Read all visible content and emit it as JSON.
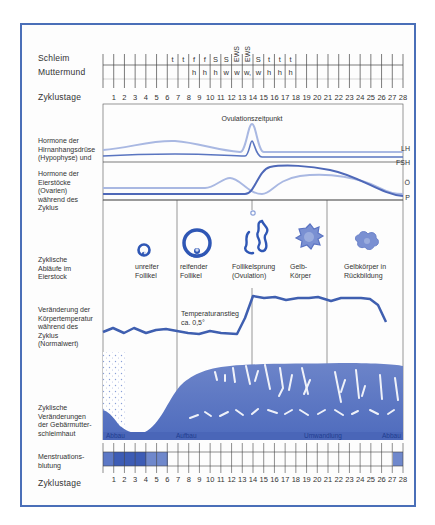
{
  "rows": {
    "schleim": {
      "label": "Schleim",
      "marks": [
        "",
        "",
        "",
        "",
        "",
        "",
        "t",
        "t",
        "f",
        "f",
        "S",
        "S",
        "EWS",
        "EWS",
        "S",
        "t",
        "t",
        "t",
        "",
        "",
        "",
        "",
        "",
        "",
        "",
        "",
        "",
        ""
      ]
    },
    "muttermund": {
      "label": "Muttermund",
      "marks": [
        "",
        "",
        "",
        "",
        "",
        "",
        "",
        "",
        "h",
        "h",
        "h",
        "w",
        "w",
        "w,",
        "w",
        "h",
        "h",
        "h",
        "",
        "",
        "",
        "",
        "",
        "",
        "",
        "",
        "",
        ""
      ]
    },
    "zyklustage_top": {
      "label": "Zyklustage"
    },
    "zyklustage_bottom": {
      "label": "Zyklustage"
    },
    "days": [
      "1",
      "2",
      "3",
      "4",
      "5",
      "6",
      "7",
      "8",
      "9",
      "10",
      "11",
      "12",
      "13",
      "14",
      "15",
      "16",
      "17",
      "18",
      "19",
      "20",
      "21",
      "22",
      "23",
      "24",
      "25",
      "26",
      "27",
      "28"
    ]
  },
  "hormones": {
    "label_pituitary": [
      "Hormone der",
      "Hirnanhangsdrüse",
      "(Hypophyse) und"
    ],
    "label_ovarian": [
      "Hormone der",
      "Eierstöcke",
      "(Ovarien)",
      "während des",
      "Zyklus"
    ],
    "ovulation_label": "Ovulationszeitpunkt",
    "curves": {
      "lh": "LH",
      "fsh": "FSH",
      "oe": "Ö",
      "p": "P"
    }
  },
  "ovary": {
    "label": [
      "Zyklische",
      "Abläufe im",
      "Eierstock"
    ],
    "stages": [
      {
        "name": [
          "unreifer",
          "Follikel"
        ]
      },
      {
        "name": [
          "reifender",
          "Follikel"
        ]
      },
      {
        "name": [
          "Follikelsprung",
          "(Ovulation)"
        ]
      },
      {
        "name": [
          "Gelb-",
          "Körper"
        ]
      },
      {
        "name": [
          "Gelbkörper in",
          "Rückbildung"
        ]
      }
    ]
  },
  "temperature": {
    "label": [
      "Veränderung der",
      "Körpertemperatur",
      "während des",
      "Zyklus",
      "(Normalwert)"
    ],
    "annotation": [
      "Temperaturanstieg",
      "ca. 0,5°"
    ]
  },
  "endometrium": {
    "label": [
      "Zyklische",
      "Veränderungen",
      "der Gebärmutter-",
      "schleimhaut"
    ],
    "phases": [
      "Abbau",
      "Aufbau",
      "Umwandlung",
      "Abbau"
    ]
  },
  "menstruation": {
    "label": [
      "Menstruations-",
      "blutung"
    ]
  },
  "colors": {
    "frame": "#4a6fb8",
    "dark_blue": "#3f5fb0",
    "light_blue": "#a9b8e2",
    "mid_blue": "#6f86c8"
  },
  "chart_data": {
    "type": "line",
    "x": [
      1,
      2,
      3,
      4,
      5,
      6,
      7,
      8,
      9,
      10,
      11,
      12,
      13,
      14,
      15,
      16,
      17,
      18,
      19,
      20,
      21,
      22,
      23,
      24,
      25,
      26,
      27,
      28
    ],
    "series": [
      {
        "name": "Körpertemperatur (relative)",
        "values": [
          0,
          0.2,
          0,
          0.2,
          0,
          0.1,
          0.1,
          0.05,
          0,
          -0.05,
          0.05,
          0.05,
          0,
          0.6,
          1.0,
          0.9,
          0.95,
          0.85,
          0.9,
          0.92,
          0.95,
          0.85,
          0.9,
          0.9,
          0.9,
          0.9,
          0.7,
          0.1
        ]
      }
    ],
    "annotations": [
      "Ovulationszeitpunkt (Tag 14)",
      "Temperaturanstieg ca. 0,5°"
    ],
    "menstruation_days": [
      1,
      2,
      3,
      4,
      5,
      6,
      28
    ]
  }
}
